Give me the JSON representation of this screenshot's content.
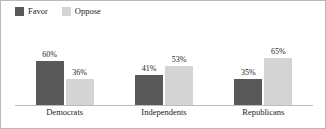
{
  "chart_data": {
    "type": "bar",
    "title": "",
    "subtitle": "",
    "xlabel": "",
    "ylabel": "",
    "ylim": [
      0,
      100
    ],
    "grid": false,
    "legend_position": "top-left",
    "categories": [
      "Democrats",
      "Independents",
      "Republicans"
    ],
    "series": [
      {
        "name": "Favor",
        "color": "#595959",
        "values": [
          60,
          41,
          35
        ],
        "labels": [
          "60%",
          "41%",
          "35%"
        ]
      },
      {
        "name": "Oppose",
        "color": "#d4d4d4",
        "values": [
          36,
          53,
          65
        ],
        "labels": [
          "36%",
          "53%",
          "65%"
        ]
      }
    ]
  },
  "legend": {
    "entries": [
      {
        "label": "Favor",
        "color": "#595959",
        "swatch_name": "legend-swatch-favor"
      },
      {
        "label": "Oppose",
        "color": "#d4d4d4",
        "swatch_name": "legend-swatch-oppose"
      }
    ]
  },
  "axis": {
    "categories": [
      "Democrats",
      "Independents",
      "Republicans"
    ]
  },
  "colors": {
    "favor": "#595959",
    "oppose": "#d4d4d4",
    "baseline": "#bdbdbd",
    "frame": "#b9b9b9",
    "text": "#1c1c1c",
    "background": "#ffffff"
  }
}
